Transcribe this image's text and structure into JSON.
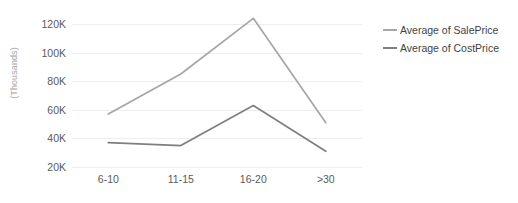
{
  "chart_data": {
    "type": "line",
    "title": "",
    "subtitle": "",
    "xlabel": "",
    "ylabel": "(Thousands)",
    "categories": [
      "6-10",
      "11-15",
      "16-20",
      ">30"
    ],
    "series": [
      {
        "name": "Average of SalePrice",
        "color": "#a6a6a6",
        "values": [
          57000,
          85000,
          124000,
          51000
        ]
      },
      {
        "name": "Average of CostPrice",
        "color": "#7f7f7f",
        "values": [
          37000,
          35000,
          63000,
          31000
        ]
      }
    ],
    "ylim": [
      20000,
      120000
    ],
    "ytick_values": [
      120000,
      100000,
      80000,
      60000,
      40000,
      20000
    ],
    "ytick_labels": [
      "120K",
      "100K",
      "80K",
      "60K",
      "40K",
      "20K"
    ],
    "grid": true,
    "grid_color": "#eeeeee",
    "legend_position": "right",
    "background": "#ffffff"
  },
  "legend": {
    "entries": [
      {
        "label": "Average of SalePrice"
      },
      {
        "label": "Average of CostPrice"
      }
    ]
  }
}
